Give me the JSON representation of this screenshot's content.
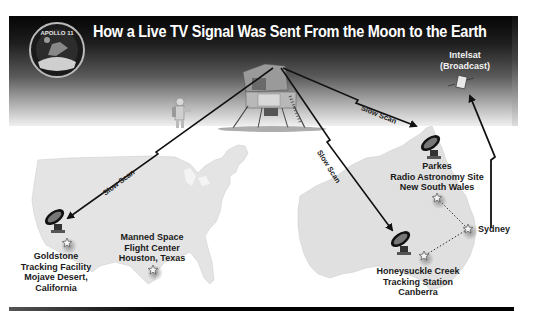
{
  "title": "How a Live TV Signal Was Sent From the Moon to the Earth",
  "badge": {
    "text": "APOLLO 11",
    "icon": "apollo-11-mission-patch"
  },
  "scene": {
    "lunar_module": {
      "icon": "lunar-module"
    },
    "astronaut": {
      "icon": "astronaut-with-camera"
    }
  },
  "satellite": {
    "name": "Intelsat",
    "role": "(Broadcast)",
    "icon": "satellite"
  },
  "links": [
    {
      "from": "Lunar Module",
      "to": "Goldstone",
      "label": "Slow Scan"
    },
    {
      "from": "Lunar Module",
      "to": "Parkes",
      "label": "Slow Scan"
    },
    {
      "from": "Lunar Module",
      "to": "Honeysuckle Creek",
      "label": "Slow Scan"
    },
    {
      "from": "Sydney",
      "to": "Intelsat",
      "label": ""
    }
  ],
  "stations": {
    "goldstone": {
      "lines": [
        "Goldstone",
        "Tracking Facility",
        "Mojave Desert,",
        "California"
      ],
      "icon": "radio-dish"
    },
    "houston": {
      "lines": [
        "Manned Space",
        "Flight Center",
        "Houston, Texas"
      ],
      "icon": "star-marker"
    },
    "parkes": {
      "lines": [
        "Parkes",
        "Radio Astronomy Site",
        "New South Wales"
      ],
      "icon": "radio-dish"
    },
    "honeysuckle": {
      "lines": [
        "Honeysuckle Creek",
        "Tracking Station",
        "Canberra"
      ],
      "icon": "radio-dish"
    },
    "sydney": {
      "lines": [
        "Sydney"
      ],
      "icon": "star-marker"
    }
  }
}
